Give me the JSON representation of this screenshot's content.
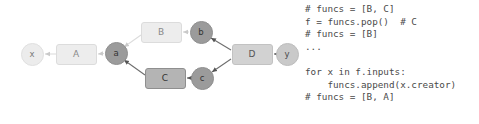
{
  "figure": {
    "colors": {
      "light_gray": "#ececec",
      "mid_gray": "#c9c9c9",
      "dark_gray": "#9b9b9b",
      "box_dark_gray": "#b4b4b4",
      "edge_light": "#d8d8d8",
      "edge_dark": "#6e6e6e",
      "text": "#4a4a4a"
    }
  },
  "graph": {
    "nodes": [
      {
        "id": "x",
        "label": "x",
        "kind": "variable",
        "shade": "light",
        "cx": 32,
        "cy": 54
      },
      {
        "id": "A",
        "label": "A",
        "kind": "function",
        "shade": "light",
        "cx": 76,
        "cy": 54
      },
      {
        "id": "a",
        "label": "a",
        "kind": "variable",
        "shade": "dark",
        "cx": 116,
        "cy": 53
      },
      {
        "id": "B",
        "label": "B",
        "kind": "function",
        "shade": "light",
        "cx": 161,
        "cy": 32
      },
      {
        "id": "b",
        "label": "b",
        "kind": "variable",
        "shade": "dark",
        "cx": 201,
        "cy": 32
      },
      {
        "id": "C",
        "label": "C",
        "kind": "function",
        "shade": "dark",
        "cx": 165,
        "cy": 78
      },
      {
        "id": "c",
        "label": "c",
        "kind": "variable",
        "shade": "dark",
        "cx": 202,
        "cy": 78
      },
      {
        "id": "D",
        "label": "D",
        "kind": "function",
        "shade": "mid",
        "cx": 252,
        "cy": 54
      },
      {
        "id": "y",
        "label": "y",
        "kind": "variable",
        "shade": "mid",
        "cx": 287,
        "cy": 54
      }
    ],
    "edges": [
      {
        "from": "A",
        "to": "x",
        "tone": "light"
      },
      {
        "from": "a",
        "to": "A",
        "tone": "light"
      },
      {
        "from": "B",
        "to": "a",
        "tone": "light"
      },
      {
        "from": "b",
        "to": "B",
        "tone": "light"
      },
      {
        "from": "C",
        "to": "a",
        "tone": "dark"
      },
      {
        "from": "c",
        "to": "C",
        "tone": "dark"
      },
      {
        "from": "D",
        "to": "b",
        "tone": "dark"
      },
      {
        "from": "D",
        "to": "c",
        "tone": "dark"
      },
      {
        "from": "y",
        "to": "D",
        "tone": "dark"
      }
    ]
  },
  "code": {
    "lines": [
      "# funcs = [B, C]",
      "f = funcs.pop()  # C",
      "# funcs = [B]",
      "...",
      "",
      "for x in f.inputs:",
      "    funcs.append(x.creator)",
      "# funcs = [B, A]"
    ]
  }
}
